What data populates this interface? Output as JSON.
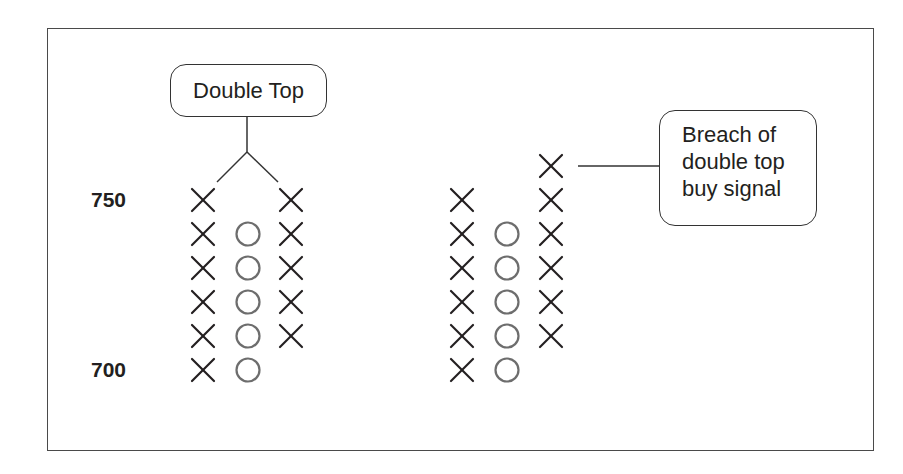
{
  "chart_data": {
    "type": "point-and-figure",
    "title": "",
    "y_labels": [
      {
        "value": 750,
        "text": "750"
      },
      {
        "value": 700,
        "text": "700"
      }
    ],
    "box_size": 10,
    "groups": [
      {
        "name": "Double Top",
        "columns": [
          {
            "type": "X",
            "from": 700,
            "to": 750,
            "boxes": 6
          },
          {
            "type": "O",
            "from": 740,
            "to": 700,
            "boxes": 5
          },
          {
            "type": "X",
            "from": 710,
            "to": 750,
            "boxes": 5
          }
        ]
      },
      {
        "name": "Breach of double top buy signal",
        "columns": [
          {
            "type": "X",
            "from": 700,
            "to": 750,
            "boxes": 6
          },
          {
            "type": "O",
            "from": 740,
            "to": 700,
            "boxes": 5
          },
          {
            "type": "X",
            "from": 710,
            "to": 760,
            "boxes": 6
          }
        ]
      }
    ],
    "annotations": [
      "Double Top",
      "Breach of double top buy signal"
    ]
  },
  "labels": {
    "price_750": "750",
    "price_700": "700",
    "double_top": "Double Top",
    "breach_line1": "Breach of",
    "breach_line2": "double top",
    "breach_line3": "buy signal"
  },
  "colors": {
    "x_mark": "#231f20",
    "o_mark": "#6d6d6d",
    "frame": "#4a4a4a"
  }
}
